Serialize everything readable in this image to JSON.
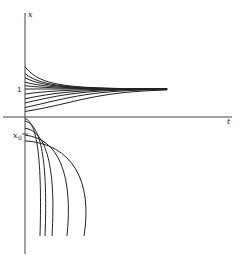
{
  "diagram": {
    "type": "solution-curves",
    "labels": {
      "y_axis": "x",
      "x_axis": "t",
      "equilibrium": "1",
      "initial_value": "x",
      "initial_value_subscript": "0"
    },
    "equilibrium_value": 1,
    "upper_initial_values": [
      1.8,
      1.55,
      1.4,
      1.25,
      1.12
    ],
    "lower_initial_values": [
      0.82,
      0.65,
      0.5,
      0.34,
      0.2
    ],
    "negative_initial_values": [
      -0.06,
      -0.15,
      -0.4,
      -0.65,
      -0.85
    ],
    "colors": {
      "ink": "#222222",
      "axis": "#444444",
      "background": "#ffffff"
    }
  }
}
